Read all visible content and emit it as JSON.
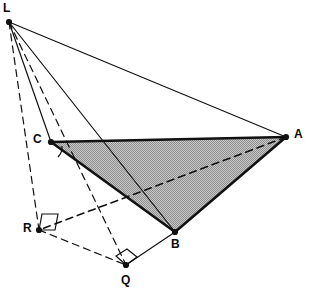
{
  "figure": {
    "width": 316,
    "height": 303,
    "background_color": "#ffffff",
    "stroke_color": "#111111",
    "shade_fill_color": "#b5b5b5",
    "shade_label": "shaded-triangle-ABC"
  },
  "points": [
    {
      "id": "L",
      "label": "L",
      "x": 9,
      "y": 22,
      "label_x": 3,
      "label_y": 2,
      "dot": true
    },
    {
      "id": "C",
      "label": "C",
      "x": 51,
      "y": 142,
      "label_x": 33,
      "label_y": 133,
      "dot": true
    },
    {
      "id": "A",
      "label": "A",
      "x": 286,
      "y": 137,
      "label_x": 294,
      "label_y": 128,
      "dot": true
    },
    {
      "id": "B",
      "label": "B",
      "x": 175,
      "y": 232,
      "label_x": 171,
      "label_y": 238,
      "dot": true
    },
    {
      "id": "R",
      "label": "R",
      "x": 39,
      "y": 230,
      "label_x": 23,
      "label_y": 222,
      "dot": true
    },
    {
      "id": "Q",
      "label": "Q",
      "x": 126,
      "y": 265,
      "label_x": 121,
      "label_y": 274,
      "dot": true
    }
  ],
  "edges": [
    {
      "name": "edge-L-A",
      "from": "L",
      "to": "A",
      "style": "solid",
      "width": 1.2
    },
    {
      "name": "edge-L-C",
      "from": "L",
      "to": "C",
      "style": "solid",
      "width": 1.2
    },
    {
      "name": "edge-L-B",
      "from": "L",
      "to": "B",
      "style": "solid",
      "width": 1.2
    },
    {
      "name": "edge-L-R",
      "from": "L",
      "to": "R",
      "style": "dashed",
      "width": 1.2
    },
    {
      "name": "edge-L-Q",
      "from": "L",
      "to": "Q",
      "style": "dashed",
      "width": 1.2
    },
    {
      "name": "edge-C-A",
      "from": "C",
      "to": "A",
      "style": "solid",
      "width": 2.6
    },
    {
      "name": "edge-C-B",
      "from": "C",
      "to": "B",
      "style": "solid",
      "width": 2.6
    },
    {
      "name": "edge-B-A",
      "from": "B",
      "to": "A",
      "style": "solid",
      "width": 2.6
    },
    {
      "name": "edge-A-R",
      "from": "A",
      "to": "R",
      "style": "dashed",
      "width": 1.6
    },
    {
      "name": "edge-R-Q",
      "from": "R",
      "to": "Q",
      "style": "dashed",
      "width": 1.2
    },
    {
      "name": "edge-Q-B",
      "from": "Q",
      "to": "B",
      "style": "solid",
      "width": 1.2
    }
  ],
  "faces": [
    {
      "name": "face-ABC",
      "vertices": [
        "C",
        "A",
        "B"
      ],
      "fill": "#b5b5b5",
      "hatched": true
    }
  ],
  "right_angle_markers": [
    {
      "name": "right-angle-marker-R",
      "at": "R",
      "points": "39,230 42,214 58,214 55,230"
    },
    {
      "name": "right-angle-marker-Q",
      "at": "Q",
      "points": "126,265 116,256 127,249 137,257"
    }
  ],
  "angle_arcs": [
    {
      "name": "angle-arc-C",
      "path": "M 62,146 A 14,14 0 0 1 58,157"
    }
  ]
}
